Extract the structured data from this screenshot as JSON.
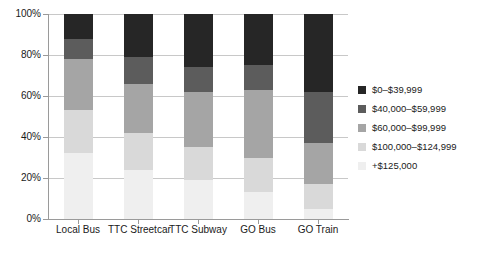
{
  "chart_data": {
    "type": "bar",
    "subtype": "stacked-bar-100-percent",
    "title": "",
    "xlabel": "",
    "ylabel": "",
    "ylim": [
      0,
      100
    ],
    "ytick_labels": [
      "0%",
      "20%",
      "40%",
      "60%",
      "80%",
      "100%"
    ],
    "ytick_values": [
      0,
      20,
      40,
      60,
      80,
      100
    ],
    "grid": true,
    "legend_position": "right",
    "categories": [
      "Local Bus",
      "TTC Streetcar",
      "TTC Subway",
      "GO Bus",
      "GO Train"
    ],
    "series": [
      {
        "name": "$0–$39,999",
        "color": "#262626",
        "values": [
          12,
          21,
          26,
          25,
          38
        ]
      },
      {
        "name": "$40,000–$59,999",
        "color": "#5c5c5c",
        "values": [
          10,
          13,
          12,
          12,
          25
        ]
      },
      {
        "name": "$60,000–$99,999",
        "color": "#a5a5a5",
        "values": [
          25,
          24,
          27,
          33,
          20
        ]
      },
      {
        "name": "$100,000–$124,999",
        "color": "#d9d9d9",
        "values": [
          21,
          18,
          16,
          17,
          12
        ]
      },
      {
        "name": "+$125,000",
        "color": "#efefef",
        "values": [
          32,
          24,
          19,
          13,
          5
        ]
      }
    ]
  },
  "legend": {
    "items": [
      {
        "label": "$0–$39,999",
        "color": "#262626"
      },
      {
        "label": "$40,000–$59,999",
        "color": "#5c5c5c"
      },
      {
        "label": "$60,000–$99,999",
        "color": "#a5a5a5"
      },
      {
        "label": "$100,000–$124,999",
        "color": "#d9d9d9"
      },
      {
        "label": "+$125,000",
        "color": "#efefef"
      }
    ]
  },
  "colors": {
    "grid": "#c8c8c8",
    "axis": "#9a9a9a",
    "text": "#1a1a1a",
    "background": "#ffffff"
  }
}
